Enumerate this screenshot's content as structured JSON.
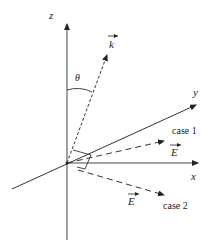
{
  "diagram": {
    "axes": {
      "z_label": "z",
      "y_label": "y",
      "x_label": "x"
    },
    "wave_vector": {
      "label": "k",
      "angle_label": "θ"
    },
    "field_vectors": [
      {
        "label": "E",
        "case_label": "case 1"
      },
      {
        "label": "E",
        "case_label": "case 2"
      }
    ],
    "colors": {
      "line": "#333333",
      "text": "#222222"
    }
  }
}
